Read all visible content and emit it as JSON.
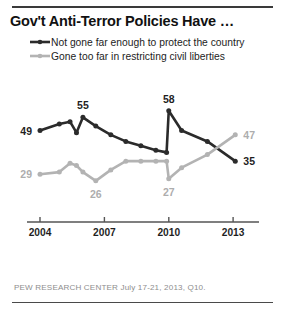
{
  "title": "Gov't Anti-Terror Policies Have …",
  "legend": [
    {
      "label": "Not gone far enough to protect the country",
      "color": "#2b2b2b",
      "series": "not_far_enough"
    },
    {
      "label": "Gone too far in restricting civil liberties",
      "color": "#b3b3b3",
      "series": "gone_too_far"
    }
  ],
  "footnote": "PEW RESEARCH CENTER July 17-21, 2013, Q10.",
  "chart_data": {
    "type": "line",
    "title": "Gov't Anti-Terror Policies Have …",
    "xlabel": "",
    "ylabel": "",
    "grid": false,
    "legend_position": "top-left",
    "xlim": [
      2004,
      2013.6
    ],
    "ylim": [
      20,
      62
    ],
    "xticks": [
      "2004",
      "2007",
      "2010",
      "2013"
    ],
    "xtick_values": [
      2004,
      2007,
      2010,
      2013
    ],
    "series": [
      {
        "name": "Not gone far enough to protect the country",
        "color": "#2b2b2b",
        "x": [
          2004.0,
          2004.9,
          2005.4,
          2005.7,
          2006.0,
          2006.6,
          2007.3,
          2008.0,
          2008.7,
          2009.4,
          2009.9,
          2010.0,
          2010.6,
          2011.8,
          2013.1
        ],
        "values": [
          49,
          52,
          53,
          48,
          55,
          51,
          47,
          44,
          42,
          40,
          39,
          58,
          49,
          44,
          35
        ],
        "labels": [
          {
            "x": 2004.0,
            "value": 49,
            "text": "49",
            "anchor": "left"
          },
          {
            "x": 2006.0,
            "value": 55,
            "text": "55",
            "anchor": "top"
          },
          {
            "x": 2010.0,
            "value": 58,
            "text": "58",
            "anchor": "top"
          },
          {
            "x": 2013.1,
            "value": 35,
            "text": "35",
            "anchor": "right"
          }
        ]
      },
      {
        "name": "Gone too far in restricting civil liberties",
        "color": "#b3b3b3",
        "x": [
          2004.0,
          2004.9,
          2005.4,
          2005.7,
          2006.0,
          2006.6,
          2007.3,
          2008.0,
          2008.7,
          2009.4,
          2009.9,
          2010.0,
          2010.6,
          2011.8,
          2013.1
        ],
        "values": [
          29,
          30,
          34,
          33,
          30,
          26,
          31,
          35,
          35,
          35,
          35,
          27,
          32,
          38,
          47
        ],
        "labels": [
          {
            "x": 2004.0,
            "value": 29,
            "text": "29",
            "anchor": "left"
          },
          {
            "x": 2006.6,
            "value": 26,
            "text": "26",
            "anchor": "bottom"
          },
          {
            "x": 2010.0,
            "value": 27,
            "text": "27",
            "anchor": "bottom"
          },
          {
            "x": 2013.1,
            "value": 47,
            "text": "47",
            "anchor": "right"
          }
        ]
      }
    ]
  }
}
